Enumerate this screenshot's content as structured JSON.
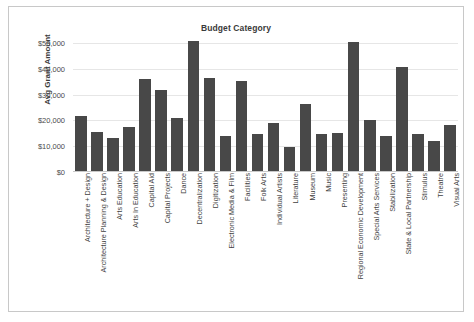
{
  "chart_data": {
    "type": "bar",
    "title": "Budget Category",
    "xlabel": "",
    "ylabel": "Avg Grant Amount",
    "ylim": [
      0,
      50000
    ],
    "ytick_values": [
      0,
      10000,
      20000,
      30000,
      40000,
      50000
    ],
    "ytick_labels": [
      "$0",
      "$10,000",
      "$20,000",
      "$30,000",
      "$40,000",
      "$50,000"
    ],
    "grid": true,
    "legend": "none",
    "bar_color": "#484848",
    "categories": [
      "Architecture + Design",
      "Architecture Planning & Design",
      "Arts Education",
      "Arts In Education",
      "Capital Aid",
      "Capital Projects",
      "Dance",
      "Decentralization",
      "Digitization",
      "Electronic Media & Film",
      "Facilities",
      "Folk Arts",
      "Individual Artists",
      "Literature",
      "Museum",
      "Music",
      "Presenting",
      "Regional Economic Development",
      "Special Arts Services",
      "Stabilization",
      "State & Local Partnership",
      "Stimulus",
      "Theatre",
      "Visual Arts"
    ],
    "values": [
      21600,
      15400,
      13300,
      17600,
      36200,
      31800,
      20900,
      50600,
      36500,
      13900,
      35300,
      14600,
      19100,
      9600,
      26400,
      14900,
      15100,
      50500,
      20100,
      13900,
      40800,
      14800,
      12200,
      18100
    ]
  }
}
